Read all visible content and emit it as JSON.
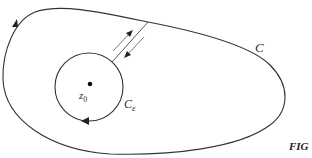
{
  "diagram": {
    "outer_contour": {
      "label": "C",
      "direction": "counterclockwise",
      "stroke": "#333333"
    },
    "inner_contour": {
      "label_main": "C",
      "label_sub": "ε",
      "direction": "clockwise",
      "stroke": "#333333"
    },
    "center_point": {
      "label_main": "z",
      "label_sub": "0"
    },
    "cut": {
      "description": "two parallel segments joining C_ε and C, traversed in opposite directions"
    },
    "caption": "FIG"
  }
}
